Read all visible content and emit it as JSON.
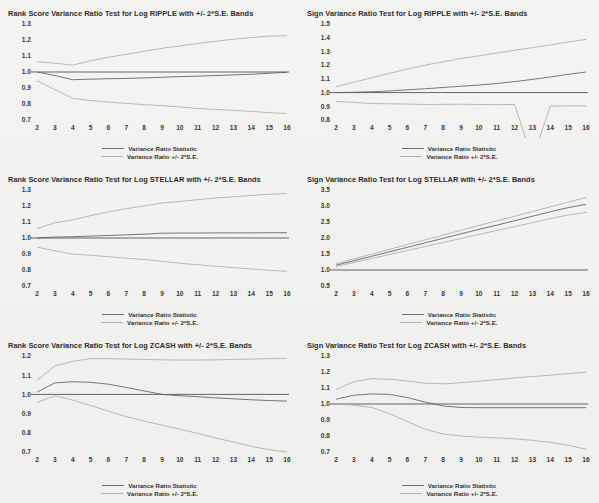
{
  "figure": {
    "background_color": "#f1f1ef",
    "panel_count": 6,
    "layout": "3 rows x 2 columns"
  },
  "legend": {
    "statistic_label": "Variance Ratio Statistic",
    "band_label": "Variance Ratio +/- 2*S.E.",
    "statistic_color": "#6e6e6e",
    "band_color": "#b0b0b0"
  },
  "chart_data": [
    {
      "type": "line",
      "id": "rank-score-ripple",
      "title": "Rank Score Variance Ratio Test for Log RIPPLE with +/- 2*S.E. Bands",
      "xlabel": "",
      "ylabel": "",
      "x": [
        2,
        3,
        4,
        5,
        6,
        7,
        8,
        9,
        10,
        11,
        12,
        13,
        14,
        15,
        16
      ],
      "xlim": [
        2,
        16
      ],
      "ylim": [
        0.7,
        1.3
      ],
      "yticks": [
        "0.7",
        "0.8",
        "0.9",
        "1.0",
        "1.1",
        "1.2",
        "1.3"
      ],
      "xticks": [
        "2",
        "3",
        "4",
        "5",
        "6",
        "7",
        "8",
        "9",
        "10",
        "11",
        "12",
        "13",
        "14",
        "15",
        "16"
      ],
      "grid": false,
      "legend_position": "below",
      "reference_line": 1.0,
      "series": [
        {
          "name": "Variance Ratio Statistic",
          "role": "statistic",
          "values": [
            1.0,
            0.978,
            0.952,
            0.955,
            0.958,
            0.96,
            0.963,
            0.967,
            0.971,
            0.974,
            0.978,
            0.982,
            0.986,
            0.992,
            0.998
          ]
        },
        {
          "name": "Upper +2 S.E.",
          "role": "band",
          "values": [
            1.065,
            1.055,
            1.043,
            1.07,
            1.093,
            1.11,
            1.13,
            1.148,
            1.163,
            1.178,
            1.192,
            1.205,
            1.215,
            1.224,
            1.227
          ]
        },
        {
          "name": "Lower -2 S.E.",
          "role": "band",
          "values": [
            0.945,
            0.89,
            0.835,
            0.822,
            0.812,
            0.804,
            0.796,
            0.79,
            0.781,
            0.772,
            0.766,
            0.76,
            0.754,
            0.746,
            0.74
          ]
        }
      ]
    },
    {
      "type": "line",
      "id": "sign-ripple",
      "title": "Sign Variance Ratio Test for Log RIPPLE with +/- 2*S.E. Bands",
      "xlabel": "",
      "ylabel": "",
      "x": [
        2,
        3,
        4,
        5,
        6,
        7,
        8,
        9,
        10,
        11,
        12,
        13,
        14,
        15,
        16
      ],
      "xlim": [
        2,
        16
      ],
      "ylim": [
        0.8,
        1.5
      ],
      "yticks": [
        "0.8",
        "0.9",
        "1.0",
        "1.1",
        "1.2",
        "1.3",
        "1.4",
        "1.5"
      ],
      "xticks": [
        "2",
        "3",
        "4",
        "5",
        "6",
        "7",
        "8",
        "9",
        "10",
        "11",
        "12",
        "13",
        "14",
        "15",
        "16"
      ],
      "grid": false,
      "legend_position": "below",
      "reference_line": 1.0,
      "series": [
        {
          "name": "Variance Ratio Statistic",
          "role": "statistic",
          "values": [
            1.0,
            1.002,
            1.006,
            1.012,
            1.02,
            1.028,
            1.037,
            1.046,
            1.055,
            1.066,
            1.08,
            1.096,
            1.114,
            1.133,
            1.15
          ]
        },
        {
          "name": "Upper +2 S.E.",
          "role": "band",
          "values": [
            1.043,
            1.075,
            1.108,
            1.14,
            1.172,
            1.2,
            1.224,
            1.248,
            1.268,
            1.288,
            1.308,
            1.328,
            1.348,
            1.368,
            1.388
          ]
        },
        {
          "name": "Lower -2 S.E.",
          "role": "band",
          "values": [
            0.936,
            0.928,
            0.92,
            0.918,
            0.916,
            0.913,
            0.914,
            0.915,
            0.913,
            0.912,
            0.913,
            0.516,
            0.902,
            0.903,
            0.903
          ]
        }
      ]
    },
    {
      "type": "line",
      "id": "rank-score-stellar",
      "title": "Rank Score Variance Ratio Test for Log STELLAR with +/- 2*S.E. Bands",
      "xlabel": "",
      "ylabel": "",
      "x": [
        2,
        3,
        4,
        5,
        6,
        7,
        8,
        9,
        10,
        11,
        12,
        13,
        14,
        15,
        16
      ],
      "xlim": [
        2,
        16
      ],
      "ylim": [
        0.7,
        1.3
      ],
      "yticks": [
        "0.7",
        "0.8",
        "0.9",
        "1.0",
        "1.1",
        "1.2",
        "1.3"
      ],
      "xticks": [
        "2",
        "3",
        "4",
        "5",
        "6",
        "7",
        "8",
        "9",
        "10",
        "11",
        "12",
        "13",
        "14",
        "15",
        "16"
      ],
      "grid": false,
      "legend_position": "below",
      "reference_line": 1.0,
      "series": [
        {
          "name": "Variance Ratio Statistic",
          "role": "statistic",
          "values": [
            1.0,
            1.006,
            1.008,
            1.012,
            1.016,
            1.02,
            1.024,
            1.03,
            1.031,
            1.031,
            1.032,
            1.032,
            1.032,
            1.033,
            1.033
          ]
        },
        {
          "name": "Upper +2 S.E.",
          "role": "band",
          "values": [
            1.058,
            1.095,
            1.113,
            1.14,
            1.163,
            1.183,
            1.201,
            1.219,
            1.228,
            1.24,
            1.25,
            1.258,
            1.266,
            1.273,
            1.278
          ]
        },
        {
          "name": "Lower -2 S.E.",
          "role": "band",
          "values": [
            0.943,
            0.92,
            0.9,
            0.892,
            0.883,
            0.874,
            0.866,
            0.854,
            0.842,
            0.833,
            0.824,
            0.815,
            0.807,
            0.798,
            0.792
          ]
        }
      ]
    },
    {
      "type": "line",
      "id": "sign-stellar",
      "title": "Sign Variance Ratio Test for Log STELLAR with +/- 2*S.E. Bands",
      "xlabel": "",
      "ylabel": "",
      "x": [
        2,
        3,
        4,
        5,
        6,
        7,
        8,
        9,
        10,
        11,
        12,
        13,
        14,
        15,
        16
      ],
      "xlim": [
        0.5,
        3.5
      ],
      "ylim": [
        0.5,
        3.5
      ],
      "yticks": [
        "0.5",
        "1.0",
        "1.5",
        "2.0",
        "2.5",
        "3.0",
        "3.5"
      ],
      "xticks": [
        "2",
        "3",
        "4",
        "5",
        "6",
        "7",
        "8",
        "9",
        "10",
        "11",
        "12",
        "13",
        "14",
        "15",
        "16"
      ],
      "grid": false,
      "legend_position": "below",
      "reference_line": 1.0,
      "series": [
        {
          "name": "Variance Ratio Statistic",
          "role": "statistic",
          "values": [
            1.15,
            1.29,
            1.43,
            1.57,
            1.71,
            1.85,
            1.99,
            2.13,
            2.27,
            2.4,
            2.54,
            2.68,
            2.82,
            2.95,
            3.05
          ]
        },
        {
          "name": "Upper +2 S.E.",
          "role": "band",
          "values": [
            1.195,
            1.345,
            1.495,
            1.645,
            1.795,
            1.945,
            2.09,
            2.24,
            2.39,
            2.535,
            2.68,
            2.825,
            2.975,
            3.12,
            3.27
          ]
        },
        {
          "name": "Lower -2 S.E.",
          "role": "band",
          "values": [
            1.11,
            1.235,
            1.36,
            1.485,
            1.61,
            1.735,
            1.86,
            1.985,
            2.11,
            2.235,
            2.355,
            2.48,
            2.605,
            2.72,
            2.8
          ]
        }
      ]
    },
    {
      "type": "line",
      "id": "rank-score-zcash",
      "title": "Rank Score Variance Ratio Test for Log ZCASH with +/- 2*S.E. Bands",
      "xlabel": "",
      "ylabel": "",
      "x": [
        2,
        3,
        4,
        5,
        6,
        7,
        8,
        9,
        10,
        11,
        12,
        13,
        14,
        15,
        16
      ],
      "xlim": [
        2,
        16
      ],
      "ylim": [
        0.7,
        1.2
      ],
      "yticks": [
        "0.7",
        "0.8",
        "0.9",
        "1.0",
        "1.1",
        "1.2"
      ],
      "xticks": [
        "2",
        "3",
        "4",
        "5",
        "6",
        "7",
        "8",
        "9",
        "10",
        "11",
        "12",
        "13",
        "14",
        "15",
        "16"
      ],
      "grid": false,
      "legend_position": "below",
      "reference_line": 1.0,
      "series": [
        {
          "name": "Variance Ratio Statistic",
          "role": "statistic",
          "values": [
            1.012,
            1.06,
            1.066,
            1.063,
            1.053,
            1.036,
            1.018,
            1.0,
            0.993,
            0.988,
            0.982,
            0.977,
            0.972,
            0.968,
            0.965
          ]
        },
        {
          "name": "Upper +2 S.E.",
          "role": "band",
          "values": [
            1.073,
            1.148,
            1.172,
            1.187,
            1.186,
            1.184,
            1.182,
            1.18,
            1.179,
            1.179,
            1.18,
            1.182,
            1.184,
            1.186,
            1.188
          ]
        },
        {
          "name": "Lower -2 S.E.",
          "role": "band",
          "values": [
            0.958,
            0.993,
            0.97,
            0.942,
            0.913,
            0.884,
            0.861,
            0.84,
            0.819,
            0.797,
            0.773,
            0.752,
            0.73,
            0.712,
            0.7
          ]
        }
      ]
    },
    {
      "type": "line",
      "id": "sign-zcash",
      "title": "Sign Variance Ratio Test for Log ZCASH with +/- 2*S.E. Bands",
      "xlabel": "",
      "ylabel": "",
      "x": [
        2,
        3,
        4,
        5,
        6,
        7,
        8,
        9,
        10,
        11,
        12,
        13,
        14,
        15,
        16
      ],
      "xlim": [
        2,
        16
      ],
      "ylim": [
        0.7,
        1.3
      ],
      "yticks": [
        "0.7",
        "0.8",
        "0.9",
        "1.0",
        "1.1",
        "1.2",
        "1.3"
      ],
      "xticks": [
        "2",
        "3",
        "4",
        "5",
        "6",
        "7",
        "8",
        "9",
        "10",
        "11",
        "12",
        "13",
        "14",
        "15",
        "16"
      ],
      "grid": false,
      "legend_position": "below",
      "reference_line": 1.0,
      "series": [
        {
          "name": "Variance Ratio Statistic",
          "role": "statistic",
          "values": [
            1.03,
            1.055,
            1.063,
            1.06,
            1.04,
            1.012,
            0.988,
            0.978,
            0.977,
            0.977,
            0.977,
            0.977,
            0.977,
            0.977,
            0.977
          ]
        },
        {
          "name": "Upper +2 S.E.",
          "role": "band",
          "values": [
            1.09,
            1.14,
            1.158,
            1.155,
            1.143,
            1.13,
            1.126,
            1.133,
            1.142,
            1.152,
            1.163,
            1.172,
            1.18,
            1.19,
            1.198
          ]
        },
        {
          "name": "Lower -2 S.E.",
          "role": "band",
          "values": [
            1.0,
            0.993,
            0.978,
            0.94,
            0.89,
            0.843,
            0.812,
            0.8,
            0.793,
            0.788,
            0.782,
            0.773,
            0.76,
            0.742,
            0.718
          ]
        }
      ]
    }
  ]
}
